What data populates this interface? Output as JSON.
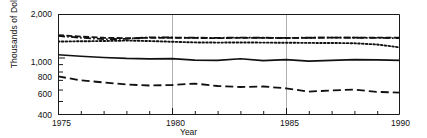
{
  "axes": {
    "y_title": "Thousands of Dollars",
    "x_title": "Year",
    "y_ticks": [
      "2,000",
      "1,000",
      "800",
      "600",
      "400"
    ],
    "x_ticks": [
      "1975",
      "1980",
      "1985",
      "1990"
    ]
  },
  "chart_data": {
    "type": "line",
    "title": "",
    "subtitle": "",
    "xlabel": "Year",
    "ylabel": "Thousands of Dollars",
    "yscale": "log",
    "ylim": [
      400,
      2000
    ],
    "xlim": [
      1975,
      1990
    ],
    "grid": "vertical-gridlines-at-1980-and-1985",
    "legend": "none",
    "y_tick_values": [
      2000,
      1000,
      800,
      600,
      400
    ],
    "y_tick_labels": [
      "2,000",
      "1,000",
      "800",
      "600",
      "400"
    ],
    "x_tick_values": [
      1975,
      1976,
      1977,
      1978,
      1979,
      1980,
      1981,
      1982,
      1983,
      1984,
      1985,
      1986,
      1987,
      1988,
      1989,
      1990
    ],
    "x_tick_labels": [
      "1975",
      "",
      "",
      "",
      "",
      "1980",
      "",
      "",
      "",
      "",
      "1985",
      "",
      "",
      "",
      "",
      "1990"
    ],
    "x": [
      1975,
      1976,
      1977,
      1978,
      1979,
      1980,
      1981,
      1982,
      1983,
      1984,
      1985,
      1986,
      1987,
      1988,
      1989,
      1990
    ],
    "series": [
      {
        "name": "dash-dot-series",
        "style": "dash-dot",
        "values": [
          1410,
          1370,
          1340,
          1345,
          1380,
          1375,
          1370,
          1368,
          1372,
          1370,
          1368,
          1370,
          1372,
          1370,
          1368,
          1360
        ]
      },
      {
        "name": "dashed-series",
        "style": "dashed-short",
        "values": [
          1430,
          1395,
          1370,
          1360,
          1368,
          1370,
          1365,
          1362,
          1368,
          1366,
          1364,
          1368,
          1372,
          1374,
          1372,
          1370
        ]
      },
      {
        "name": "dotted-series",
        "style": "dotted",
        "values": [
          1290,
          1295,
          1300,
          1310,
          1300,
          1285,
          1272,
          1268,
          1270,
          1268,
          1265,
          1262,
          1260,
          1255,
          1230,
          1175
        ]
      },
      {
        "name": "solid-series",
        "style": "solid",
        "values": [
          1045,
          1020,
          1000,
          985,
          978,
          982,
          960,
          955,
          980,
          950,
          968,
          945,
          955,
          968,
          962,
          955
        ]
      },
      {
        "name": "long-dashed-series",
        "style": "dashed-long",
        "values": [
          740,
          695,
          672,
          650,
          640,
          645,
          660,
          635,
          625,
          630,
          612,
          580,
          592,
          600,
          578,
          572
        ]
      }
    ]
  }
}
